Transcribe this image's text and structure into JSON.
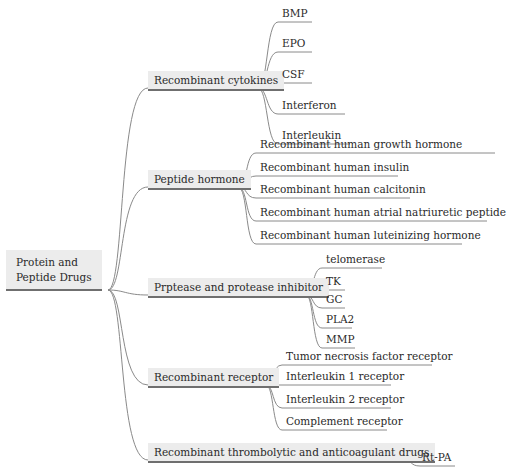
{
  "diagram": {
    "type": "mind-map",
    "root": {
      "label_line1": "Protein and",
      "label_line2": "Peptide Drugs"
    },
    "branches": [
      {
        "label": "Recombinant cytokines",
        "children": [
          "BMP",
          "EPO",
          "CSF",
          "Interferon",
          "Interleukin"
        ]
      },
      {
        "label": "Peptide hormone",
        "children": [
          "Recombinant human growth hormone",
          "Recombinant human insulin",
          "Recombinant human calcitonin",
          "Recombinant human atrial natriuretic peptide",
          "Recombinant human luteinizing hormone"
        ]
      },
      {
        "label": "Prptease and protease inhibitor",
        "children": [
          "telomerase",
          "TK",
          "GC",
          "PLA2",
          "MMP"
        ]
      },
      {
        "label": "Recombinant receptor",
        "children": [
          "Tumor necrosis factor receptor",
          "Interleukin 1 receptor",
          "Interleukin 2 receptor",
          "Complement receptor"
        ]
      },
      {
        "label": "Recombinant thrombolytic and anticoagulant drugs",
        "children": [
          "Rt-PA"
        ]
      }
    ],
    "colors": {
      "node_fill": "#ececec",
      "node_underline": "#6f6f6f",
      "link": "#8a8a8a"
    }
  }
}
